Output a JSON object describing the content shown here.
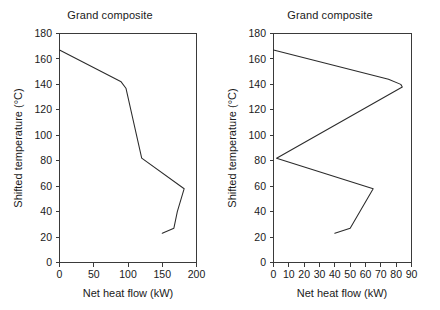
{
  "figure": {
    "background": "#ffffff",
    "line_color": "#2b2b2b",
    "axis_color": "#3a3a3a"
  },
  "chart_data": [
    {
      "type": "line",
      "panel": "left",
      "title": "Grand composite",
      "xlabel": "Net heat flow (kW)",
      "ylabel": "Shifted temperature (°C)",
      "xlim": [
        0,
        200
      ],
      "ylim": [
        0,
        180
      ],
      "xticks": [
        0,
        50,
        100,
        150,
        200
      ],
      "yticks": [
        0,
        20,
        40,
        60,
        80,
        100,
        120,
        140,
        160,
        180
      ],
      "xtick_labels": [
        "0",
        "50",
        "100",
        "150",
        "200"
      ],
      "ytick_labels": [
        "0",
        "20",
        "40",
        "60",
        "80",
        "100",
        "120",
        "140",
        "160",
        "180"
      ],
      "grid": false,
      "legend": "none",
      "series": [
        {
          "name": "Grand composite curve",
          "x": [
            0,
            90,
            97,
            120,
            182,
            172,
            167,
            150
          ],
          "y": [
            167,
            142,
            137,
            82,
            58,
            40,
            27,
            23
          ]
        }
      ]
    },
    {
      "type": "line",
      "panel": "right",
      "title": "Grand composite",
      "xlabel": "Net heat flow (kW)",
      "ylabel": "Shifted temperature (°C)",
      "xlim": [
        0,
        90
      ],
      "ylim": [
        0,
        180
      ],
      "xticks": [
        0,
        10,
        20,
        30,
        40,
        50,
        60,
        70,
        80,
        90
      ],
      "yticks": [
        0,
        20,
        40,
        60,
        80,
        100,
        120,
        140,
        160,
        180
      ],
      "xtick_labels": [
        "0",
        "10",
        "20",
        "30",
        "40",
        "50",
        "60",
        "70",
        "80",
        "90"
      ],
      "ytick_labels": [
        "0",
        "20",
        "40",
        "60",
        "80",
        "100",
        "120",
        "140",
        "160",
        "180"
      ],
      "grid": false,
      "legend": "none",
      "series": [
        {
          "name": "Grand composite curve",
          "x": [
            0,
            75,
            83,
            84,
            2,
            65,
            50,
            40
          ],
          "y": [
            167,
            144,
            140,
            138,
            82,
            58,
            27,
            23
          ]
        }
      ]
    }
  ]
}
